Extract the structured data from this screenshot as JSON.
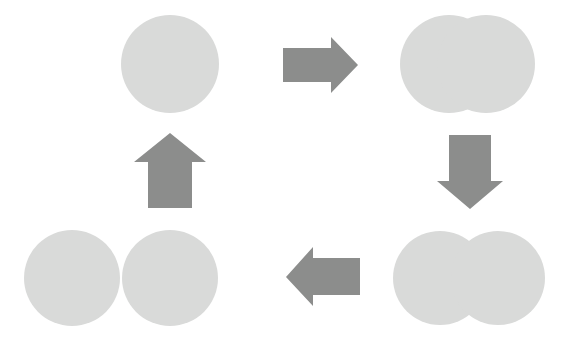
{
  "figure": {
    "background_color": "#ffffff",
    "width": 572,
    "height": 349
  },
  "palette": {
    "cell_fill": "#d9dad9",
    "arrow_fill": "#8c8d8c"
  },
  "stages": [
    {
      "id": "stage-1-single-cell",
      "label": "single round cell",
      "position": "top-left",
      "circle_count": 1,
      "circles": [
        {
          "cx": 170,
          "cy": 64,
          "r": 49
        }
      ]
    },
    {
      "id": "stage-2-elongated-cell",
      "label": "elongated cell, slight constriction",
      "position": "top-right",
      "circle_count": 2,
      "circles": [
        {
          "cx": 449,
          "cy": 64,
          "r": 49
        },
        {
          "cx": 486,
          "cy": 64,
          "r": 49
        }
      ]
    },
    {
      "id": "stage-3-constricted-cell",
      "label": "constricted cell, deep furrow",
      "position": "bottom-right",
      "circle_count": 2,
      "circles": [
        {
          "cx": 440,
          "cy": 278,
          "r": 47
        },
        {
          "cx": 498,
          "cy": 278,
          "r": 47
        }
      ]
    },
    {
      "id": "stage-4-two-daughter-cells",
      "label": "two separated daughter cells",
      "position": "bottom-left",
      "circle_count": 2,
      "circles": [
        {
          "cx": 72,
          "cy": 278,
          "r": 48
        },
        {
          "cx": 170,
          "cy": 278,
          "r": 48
        }
      ]
    }
  ],
  "arrows": [
    {
      "id": "arrow-right-top",
      "label": "growth to elongation",
      "direction": "right",
      "points": "283,48 331,48 331,37 358,65 331,93 331,82 283,82"
    },
    {
      "id": "arrow-down-right",
      "label": "elongation to constriction",
      "direction": "down",
      "points": "449,135 491,135 491,181 503,181 470,209 437,181 449,181"
    },
    {
      "id": "arrow-left-bottom",
      "label": "constriction to separation",
      "direction": "left",
      "points": "360,258 313,258 313,247 286,277 313,306 313,295 360,295"
    },
    {
      "id": "arrow-up-left",
      "label": "separation back to single cell",
      "direction": "up",
      "points": "148,208 148,162 134,162 170,133 206,162 192,162 192,208"
    }
  ]
}
